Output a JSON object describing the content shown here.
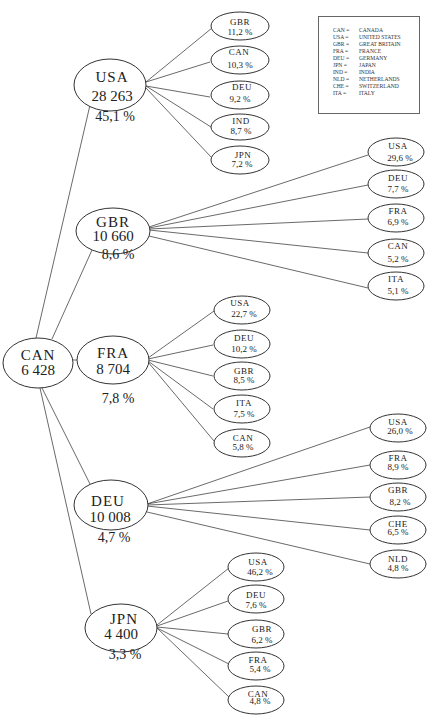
{
  "legend": {
    "items": [
      {
        "code": "CAN",
        "name": "CANADA"
      },
      {
        "code": "USA",
        "name": "UNITED STATES"
      },
      {
        "code": "GBR",
        "name": "GREAT BRITAIN"
      },
      {
        "code": "FRA",
        "name": "FRANCE"
      },
      {
        "code": "DEU",
        "name": "GERMANY"
      },
      {
        "code": "JPN",
        "name": "JAPAN"
      },
      {
        "code": "IND",
        "name": "INDIA"
      },
      {
        "code": "NLD",
        "name": "NETHERLANDS"
      },
      {
        "code": "CHE",
        "name": "SWITZERLAND"
      },
      {
        "code": "ITA",
        "name": "ITALY"
      }
    ],
    "separator": "="
  },
  "root": {
    "code": "CAN",
    "value": "6 428"
  },
  "partners": [
    {
      "code": "USA",
      "value": "28 263",
      "share": "45,1 %",
      "children": [
        {
          "code": "GBR",
          "share": "11,2 %"
        },
        {
          "code": "CAN",
          "share": "10,3 %"
        },
        {
          "code": "DEU",
          "share": "9,2 %"
        },
        {
          "code": "IND",
          "share": "8,7 %"
        },
        {
          "code": "JPN",
          "share": "7,2 %"
        }
      ]
    },
    {
      "code": "GBR",
      "value": "10 660",
      "share": "8,6 %",
      "children": [
        {
          "code": "USA",
          "share": "29,6 %"
        },
        {
          "code": "DEU",
          "share": "7,7 %"
        },
        {
          "code": "FRA",
          "share": "6,9 %"
        },
        {
          "code": "CAN",
          "share": "5,2 %"
        },
        {
          "code": "ITA",
          "share": "5,1 %"
        }
      ]
    },
    {
      "code": "FRA",
      "value": "8 704",
      "share": "7,8 %",
      "children": [
        {
          "code": "USA",
          "share": "22,7 %"
        },
        {
          "code": "DEU",
          "share": "10,2 %"
        },
        {
          "code": "GBR",
          "share": "8,5 %"
        },
        {
          "code": "ITA",
          "share": "7,5 %"
        },
        {
          "code": "CAN",
          "share": "5,8 %"
        }
      ]
    },
    {
      "code": "DEU",
      "value": "10 008",
      "share": "4,7 %",
      "children": [
        {
          "code": "USA",
          "share": "26,0 %"
        },
        {
          "code": "FRA",
          "share": "8,9 %"
        },
        {
          "code": "GBR",
          "share": "8,2 %"
        },
        {
          "code": "CHE",
          "share": "6,5 %"
        },
        {
          "code": "NLD",
          "share": "4,8 %"
        }
      ]
    },
    {
      "code": "JPN",
      "value": "4 400",
      "share": "3,3 %",
      "children": [
        {
          "code": "USA",
          "share": "46,2 %"
        },
        {
          "code": "DEU",
          "share": "7,6 %"
        },
        {
          "code": "GBR",
          "share": "6,2 %"
        },
        {
          "code": "FRA",
          "share": "5,4 %"
        },
        {
          "code": "CAN",
          "share": "4,8 %"
        }
      ]
    }
  ]
}
